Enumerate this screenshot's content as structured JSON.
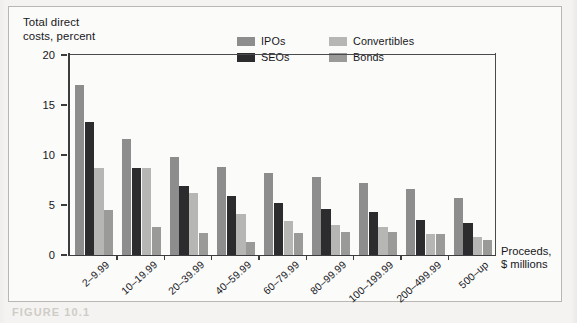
{
  "figure": {
    "caption": "FIGURE 10.1",
    "y_axis_title": "Total direct\ncosts, percent",
    "x_axis_title": "Proceeds,\n$ millions"
  },
  "legend": {
    "items": [
      {
        "label": "IPOs",
        "key": "ipos",
        "color": "#8d8d8d"
      },
      {
        "label": "Convertibles",
        "key": "convertibles",
        "color": "#b6b6b4"
      },
      {
        "label": "SEOs",
        "key": "seos",
        "color": "#2c2c2e"
      },
      {
        "label": "Bonds",
        "key": "bonds",
        "color": "#9a9a98"
      }
    ]
  },
  "chart_data": {
    "type": "bar",
    "title": "",
    "xlabel": "Proceeds, $ millions",
    "ylabel": "Total direct costs, percent",
    "ylim": [
      0,
      20
    ],
    "yticks": [
      0,
      5,
      10,
      15,
      20
    ],
    "grid": false,
    "legend_position": "top-center",
    "categories": [
      "2–9.99",
      "10–19.99",
      "20–39.99",
      "40–59.99",
      "60–79.99",
      "80–99.99",
      "100–199.99",
      "200–499.99",
      "500–up"
    ],
    "series": [
      {
        "name": "IPOs",
        "color": "#8d8d8d",
        "values": [
          17.0,
          11.6,
          9.8,
          8.8,
          8.2,
          7.8,
          7.2,
          6.6,
          5.7
        ]
      },
      {
        "name": "SEOs",
        "color": "#2c2c2e",
        "values": [
          13.3,
          8.7,
          6.9,
          5.9,
          5.2,
          4.6,
          4.3,
          3.5,
          3.2
        ]
      },
      {
        "name": "Convertibles",
        "color": "#b6b6b4",
        "values": [
          8.7,
          8.7,
          6.2,
          4.1,
          3.4,
          3.0,
          2.8,
          2.1,
          1.8
        ]
      },
      {
        "name": "Bonds",
        "color": "#9a9a98",
        "values": [
          4.5,
          2.8,
          2.2,
          1.3,
          2.2,
          2.3,
          2.3,
          2.1,
          1.5
        ]
      }
    ]
  }
}
